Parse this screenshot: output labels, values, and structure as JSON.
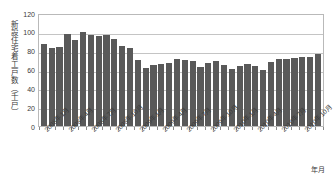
{
  "chart_data": {
    "type": "bar",
    "title": "",
    "ylabel": "新設住宅着工戸数（千戸）",
    "xlabel": "年月",
    "ylim": [
      0,
      120
    ],
    "yticks": [
      0,
      20,
      40,
      60,
      80,
      100,
      120
    ],
    "grid": true,
    "legend": null,
    "bar_color": "#595959",
    "grid_color": "#c4c4c4",
    "border_color": "#b9b9b9",
    "categories": [
      "2008年1月",
      "2008年2月",
      "2008年3月",
      "2008年4月",
      "2008年5月",
      "2008年6月",
      "2008年7月",
      "2008年8月",
      "2008年9月",
      "2008年10月",
      "2008年11月",
      "2008年12月",
      "2009年1月",
      "2009年2月",
      "2009年3月",
      "2009年4月",
      "2009年5月",
      "2009年6月",
      "2009年7月",
      "2009年8月",
      "2009年9月",
      "2009年10月",
      "2009年11月",
      "2009年12月",
      "2010年1月",
      "2010年2月",
      "2010年3月",
      "2010年4月",
      "2010年5月",
      "2010年6月",
      "2010年7月",
      "2010年8月",
      "2010年9月",
      "2010年10月",
      "2010年11月",
      "2010年12月"
    ],
    "values": [
      87,
      83,
      84,
      98,
      91,
      100,
      97,
      96,
      97,
      92,
      85,
      83,
      70,
      62,
      65,
      66,
      67,
      71,
      70,
      69,
      63,
      67,
      69,
      65,
      61,
      64,
      66,
      64,
      59,
      68,
      71,
      71,
      72,
      73,
      73,
      76
    ],
    "tick_label_indices": [
      0,
      3,
      6,
      9,
      12,
      15,
      18,
      21,
      24,
      27,
      30,
      33
    ],
    "tick_labels": [
      "2008年1月",
      "2008年4月",
      "2008年7月",
      "2008年10月",
      "2009年1月",
      "2009年4月",
      "2009年7月",
      "2009年10月",
      "2010年1月",
      "2010年4月",
      "2010年7月",
      "2010年10月"
    ]
  }
}
